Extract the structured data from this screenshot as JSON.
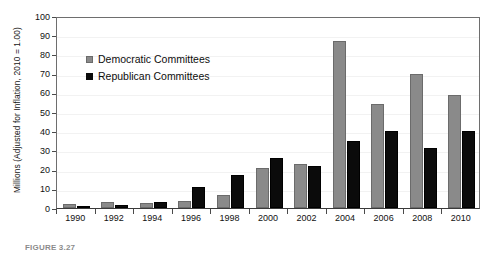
{
  "chart_data": {
    "type": "bar",
    "title": "",
    "xlabel": "",
    "ylabel": "Millions (Adjusted for Inflation, 2010 = 1.00)",
    "ylim": [
      0,
      100
    ],
    "yticks": [
      0,
      10,
      20,
      30,
      40,
      50,
      60,
      70,
      80,
      90,
      100
    ],
    "grid": true,
    "legend_position": "upper-left-inside",
    "categories": [
      "1990",
      "1992",
      "1994",
      "1996",
      "1998",
      "2000",
      "2002",
      "2004",
      "2006",
      "2008",
      "2010"
    ],
    "series": [
      {
        "name": "Democratic Committees",
        "color": "#8a8a8a",
        "values": [
          2,
          3,
          2.5,
          3.5,
          7,
          21,
          23,
          87,
          54,
          70,
          59
        ]
      },
      {
        "name": "Republican Committees",
        "color": "#0b0b0b",
        "values": [
          1,
          1.5,
          3,
          11,
          17,
          26,
          22,
          35,
          40,
          31,
          40
        ]
      }
    ]
  },
  "legend": {
    "items": [
      {
        "label": "Democratic Committees",
        "key": "dem"
      },
      {
        "label": "Republican Committees",
        "key": "rep"
      }
    ]
  },
  "caption": {
    "text": "FIGURE 3.27"
  }
}
